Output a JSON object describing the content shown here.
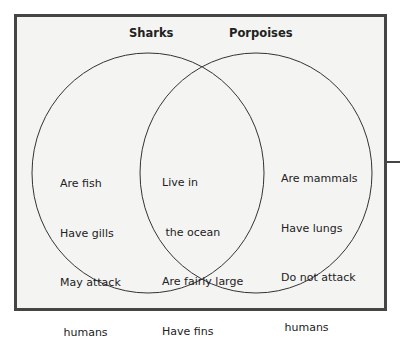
{
  "diagram": {
    "type": "venn",
    "sets": [
      {
        "label": "Sharks",
        "unique_items": [
          "Are fish",
          "Have gills",
          "May attack",
          " humans"
        ]
      },
      {
        "label": "Porpoises",
        "unique_items": [
          "Are mammals",
          "Have lungs",
          "Do not attack",
          " humans"
        ]
      }
    ],
    "overlap_items": [
      "Live in",
      " the ocean",
      "Are fairly large",
      "Have fins"
    ],
    "colors": {
      "border": "#454545",
      "fill": "#f4f4f3",
      "stroke": "#333333",
      "text": "#222222"
    }
  }
}
